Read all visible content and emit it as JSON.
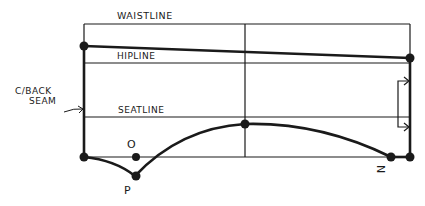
{
  "diagram": {
    "type": "pattern-drafting-sketch",
    "labels": {
      "waistline": "WAISTLINE",
      "hipline": "HIPLINE",
      "seatline": "SEATLINE",
      "back_seam_line1": "C/BACK",
      "back_seam_line2": "SEAM",
      "point_o": "O",
      "point_p": "P",
      "point_n": "N"
    },
    "colors": {
      "ink": "#1a1a1a",
      "background": "#ffffff"
    }
  }
}
